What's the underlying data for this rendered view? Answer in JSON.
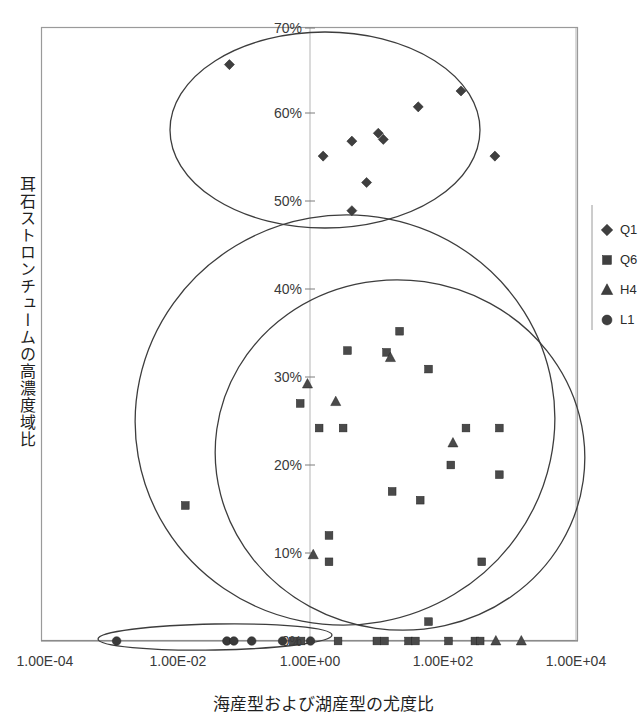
{
  "chart_data": {
    "type": "scatter",
    "title": "",
    "xlabel": "海産型および湖産型の尤度比",
    "ylabel": "耳石ストロンチュームの高濃度域比",
    "x_scale": "log",
    "xlim": [
      0.0001,
      10000
    ],
    "ylim": [
      0,
      0.7
    ],
    "grid": true,
    "legend_position": "right",
    "xticklabels": [
      "1.00E-04",
      "1.00E-02",
      "1.00E+00",
      "1.00E+02",
      "1.00E+04"
    ],
    "xtickvalues": [
      0.0001,
      0.01,
      1,
      100,
      10000
    ],
    "yticklabels": [
      "0%",
      "10%",
      "20%",
      "30%",
      "40%",
      "50%",
      "60%",
      "70%"
    ],
    "ytickvalues": [
      0,
      0.1,
      0.2,
      0.3,
      0.4,
      0.5,
      0.6,
      0.7
    ],
    "series": [
      {
        "name": "Q1",
        "marker": "diamond",
        "color": "#3f3f3f",
        "points": [
          [
            0.06,
            0.655
          ],
          [
            185.0,
            0.625
          ],
          [
            42.0,
            0.607
          ],
          [
            10.5,
            0.577
          ],
          [
            12.5,
            0.57
          ],
          [
            4.2,
            0.568
          ],
          [
            1.55,
            0.551
          ],
          [
            600.0,
            0.551
          ],
          [
            7.0,
            0.521
          ],
          [
            4.2,
            0.489
          ]
        ]
      },
      {
        "name": "Q6",
        "marker": "square",
        "color": "#4a4a4a",
        "points": [
          [
            22.0,
            0.352
          ],
          [
            3.6,
            0.33
          ],
          [
            14.0,
            0.328
          ],
          [
            60.0,
            0.309
          ],
          [
            0.7,
            0.27
          ],
          [
            1.35,
            0.242
          ],
          [
            3.1,
            0.242
          ],
          [
            220.0,
            0.242
          ],
          [
            700.0,
            0.242
          ],
          [
            130.0,
            0.2
          ],
          [
            700.0,
            0.189
          ],
          [
            0.013,
            0.154
          ],
          [
            17.0,
            0.17
          ],
          [
            45.0,
            0.16
          ],
          [
            1.9,
            0.12
          ],
          [
            1.9,
            0.09
          ],
          [
            380.0,
            0.09
          ],
          [
            60.0,
            0.022
          ],
          [
            2.6,
            0.0
          ],
          [
            10.0,
            0.0
          ],
          [
            13.0,
            0.0
          ],
          [
            30.0,
            0.0
          ],
          [
            38.0,
            0.0
          ],
          [
            120.0,
            0.0
          ],
          [
            300.0,
            0.0
          ],
          [
            360.0,
            0.0
          ],
          [
            0.55,
            0.0
          ],
          [
            0.72,
            0.0
          ]
        ]
      },
      {
        "name": "H4",
        "marker": "triangle",
        "color": "#4a4a4a",
        "points": [
          [
            0.9,
            0.292
          ],
          [
            2.4,
            0.272
          ],
          [
            16.0,
            0.322
          ],
          [
            140.0,
            0.225
          ],
          [
            1.1,
            0.098
          ],
          [
            620.0,
            0.0
          ],
          [
            1500.0,
            0.0
          ]
        ]
      },
      {
        "name": "L1",
        "marker": "circle",
        "color": "#3a3a3a",
        "points": [
          [
            0.0012,
            0.0
          ],
          [
            0.055,
            0.0
          ],
          [
            0.07,
            0.0
          ],
          [
            0.13,
            0.0
          ],
          [
            0.38,
            0.0
          ],
          [
            1.0,
            0.0
          ]
        ]
      }
    ],
    "ellipses": [
      {
        "name": "upper-Q1-ellipse",
        "cx_px": 325,
        "cy_px": 130,
        "rx_px": 155,
        "ry_px": 98,
        "rotate": 0
      },
      {
        "name": "mid-large-ellipse",
        "cx_px": 345,
        "cy_px": 420,
        "rx_px": 210,
        "ry_px": 205,
        "rotate": -10
      },
      {
        "name": "mid-right-ellipse",
        "cx_px": 400,
        "cy_px": 455,
        "rx_px": 185,
        "ry_px": 175,
        "rotate": 8
      },
      {
        "name": "baseline-flat-ellipse",
        "cx_px": 215,
        "cy_px": 637,
        "rx_px": 117,
        "ry_px": 13,
        "rotate": -1
      }
    ]
  },
  "legend": {
    "items": [
      {
        "label": "Q1",
        "marker": "diamond"
      },
      {
        "label": "Q6",
        "marker": "square"
      },
      {
        "label": "H4",
        "marker": "triangle"
      },
      {
        "label": "L1",
        "marker": "circle"
      }
    ]
  },
  "axes": {
    "x_title": "海産型および湖産型の尤度比",
    "y_title": "耳石ストロンチュームの高濃度域比",
    "x_ticks": [
      {
        "label": "1.00E-04",
        "x_px": 45
      },
      {
        "label": "1.00E-02",
        "x_px": 178
      },
      {
        "label": "1.00E+00",
        "x_px": 310
      },
      {
        "label": "1.00E+02",
        "x_px": 443
      },
      {
        "label": "1.00E+04",
        "x_px": 576
      }
    ],
    "y_ticks": [
      {
        "label": "70%",
        "y_px": 28
      },
      {
        "label": "60%",
        "y_px": 113
      },
      {
        "label": "50%",
        "y_px": 201
      },
      {
        "label": "40%",
        "y_px": 289
      },
      {
        "label": "30%",
        "y_px": 377
      },
      {
        "label": "20%",
        "y_px": 465
      },
      {
        "label": "10%",
        "y_px": 553
      },
      {
        "label": "0%",
        "y_px": 641
      }
    ]
  }
}
